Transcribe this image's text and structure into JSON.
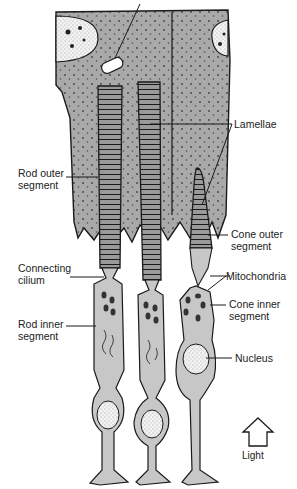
{
  "figure": {
    "colors": {
      "cell_fill": "#c7c7c7",
      "epithelium_fill": "#a9a9a9",
      "outline": "#1a1a1a",
      "text": "#222222",
      "background": "#ffffff"
    }
  },
  "labels": {
    "lamellae": "Lamellae",
    "rod_outer_segment": "Rod outer\nsegment",
    "cone_outer_segment": "Cone outer\nsegment",
    "mitochondria": "Mitochondria",
    "connecting_cilium": "Connecting\ncilium",
    "cone_inner_segment": "Cone inner\nsegment",
    "rod_inner_segment": "Rod inner\nsegment",
    "nucleus": "Nucleus",
    "light": "Light"
  }
}
